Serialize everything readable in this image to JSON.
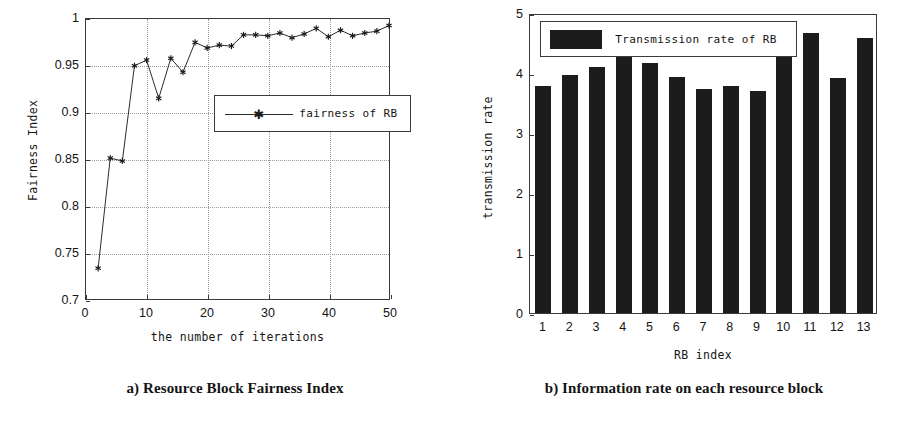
{
  "figure": {
    "panels": [
      {
        "id": "a",
        "caption": "a) Resource Block Fairness Index"
      },
      {
        "id": "b",
        "caption": "b) Information rate on each resource block"
      }
    ]
  },
  "chart_data": [
    {
      "type": "line",
      "title": "",
      "xlabel": "the number of iterations",
      "ylabel": "Fairness Index",
      "xlim": [
        0,
        50
      ],
      "ylim": [
        0.7,
        1
      ],
      "xticks": [
        "0",
        "10",
        "20",
        "30",
        "40",
        "50"
      ],
      "xtick_values": [
        0,
        10,
        20,
        30,
        40,
        50
      ],
      "yticks": [
        "0.7",
        "0.75",
        "0.8",
        "0.85",
        "0.9",
        "0.95",
        "1"
      ],
      "ytick_values": [
        0.7,
        0.75,
        0.8,
        0.85,
        0.9,
        0.95,
        1
      ],
      "grid": "dotted",
      "legend_position": "center",
      "legend": [
        "fairness of RB"
      ],
      "marker": "star",
      "series": [
        {
          "name": "fairness of RB",
          "x": [
            2,
            4,
            6,
            8,
            10,
            12,
            14,
            16,
            18,
            20,
            22,
            24,
            26,
            28,
            30,
            32,
            34,
            36,
            38,
            40,
            42,
            44,
            46,
            48,
            50
          ],
          "values": [
            0.733,
            0.851,
            0.848,
            0.95,
            0.956,
            0.915,
            0.958,
            0.943,
            0.975,
            0.969,
            0.972,
            0.971,
            0.983,
            0.983,
            0.982,
            0.985,
            0.98,
            0.984,
            0.99,
            0.981,
            0.988,
            0.982,
            0.985,
            0.987,
            0.993
          ]
        }
      ]
    },
    {
      "type": "bar",
      "title": "",
      "xlabel": "RB index",
      "ylabel": "transmission rate",
      "ylim": [
        0,
        5
      ],
      "yticks": [
        "0",
        "1",
        "2",
        "3",
        "4",
        "5"
      ],
      "ytick_values": [
        0,
        1,
        2,
        3,
        4,
        5
      ],
      "grid": "off",
      "legend_position": "top-left",
      "legend": [
        "Transmission rate of RB"
      ],
      "bar_color": "#1c1c1c",
      "categories": [
        "1",
        "2",
        "3",
        "4",
        "5",
        "6",
        "7",
        "8",
        "9",
        "10",
        "11",
        "12",
        "13"
      ],
      "values": [
        3.79,
        3.96,
        4.1,
        4.42,
        4.16,
        3.94,
        3.74,
        3.78,
        3.7,
        4.27,
        4.67,
        3.91,
        4.58
      ]
    }
  ],
  "colors": {
    "axis": "#3a3a3a",
    "grid": "#9a9a9a",
    "ink": "#141414",
    "bar": "#1c1c1c",
    "background": "#ffffff"
  }
}
